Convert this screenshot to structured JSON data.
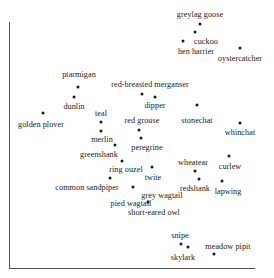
{
  "chart_data": {
    "type": "scatter",
    "title": "",
    "xlabel": "",
    "ylabel": "",
    "grid": false,
    "legend": null,
    "axis_ticks": {
      "x": [],
      "y": []
    },
    "axis_range_px": {
      "x": [
        9,
        255
      ],
      "y": [
        22,
        268
      ]
    },
    "point_color": "#1a1a1a",
    "axis_color": "#555555",
    "background": "#ffffff",
    "points": [
      {
        "label": "greylag goose",
        "x": 200,
        "y": 24,
        "label_x": 200,
        "label_y": 14
      },
      {
        "label": "cuckoo",
        "x": 195,
        "y": 32,
        "label_x": 206,
        "label_y": 41
      },
      {
        "label": "hen harrier",
        "x": 183,
        "y": 41,
        "label_x": 196,
        "label_y": 51
      },
      {
        "label": "oystercatcher",
        "x": 240,
        "y": 48,
        "label_x": 240,
        "label_y": 58
      },
      {
        "label": "ptarmigan",
        "x": 78,
        "y": 87,
        "label_x": 79,
        "label_y": 74
      },
      {
        "label": "dunlin",
        "x": 74,
        "y": 97,
        "label_x": 74,
        "label_y": 106
      },
      {
        "label": "red-breasted merganser",
        "x": 142,
        "y": 94,
        "label_x": 150,
        "label_y": 84
      },
      {
        "label": "dipper",
        "x": 155,
        "y": 97,
        "label_x": 155,
        "label_y": 105
      },
      {
        "label": "golden plover",
        "x": 43,
        "y": 113,
        "label_x": 41,
        "label_y": 124
      },
      {
        "label": "teal",
        "x": 101,
        "y": 122,
        "label_x": 101,
        "label_y": 113
      },
      {
        "label": "merlin",
        "x": 101,
        "y": 131,
        "label_x": 102,
        "label_y": 139
      },
      {
        "label": "red grouse",
        "x": 139,
        "y": 130,
        "label_x": 142,
        "label_y": 120
      },
      {
        "label": "stonechat",
        "x": 197,
        "y": 105,
        "label_x": 197,
        "label_y": 120
      },
      {
        "label": "whinchat",
        "x": 240,
        "y": 123,
        "label_x": 240,
        "label_y": 132
      },
      {
        "label": "peregrine",
        "x": 141,
        "y": 138,
        "label_x": 147,
        "label_y": 147
      },
      {
        "label": "greenshank",
        "x": 115,
        "y": 145,
        "label_x": 99,
        "label_y": 154
      },
      {
        "label": "ring ouzel",
        "x": 122,
        "y": 161,
        "label_x": 126,
        "label_y": 169
      },
      {
        "label": "twite",
        "x": 152,
        "y": 167,
        "label_x": 153,
        "label_y": 177
      },
      {
        "label": "wheatear",
        "x": 195,
        "y": 171,
        "label_x": 193,
        "label_y": 162
      },
      {
        "label": "curlew",
        "x": 229,
        "y": 156,
        "label_x": 230,
        "label_y": 166
      },
      {
        "label": "common sandpiper",
        "x": 110,
        "y": 178,
        "label_x": 87,
        "label_y": 187
      },
      {
        "label": "redshank",
        "x": 199,
        "y": 179,
        "label_x": 195,
        "label_y": 188
      },
      {
        "label": "lapwing",
        "x": 222,
        "y": 181,
        "label_x": 228,
        "label_y": 191
      },
      {
        "label": "grey wagtail",
        "x": 133,
        "y": 187,
        "label_x": 162,
        "label_y": 195
      },
      {
        "label": "pied wagtail",
        "x": 148,
        "y": 202,
        "label_x": 131,
        "label_y": 203
      },
      {
        "label": "short-eared owl",
        "x": 0,
        "y": 0,
        "label_x": 154,
        "label_y": 212,
        "no_point": true
      },
      {
        "label": "snipe",
        "x": 181,
        "y": 244,
        "label_x": 180,
        "label_y": 235
      },
      {
        "label": "skylark",
        "x": 188,
        "y": 247,
        "label_x": 183,
        "label_y": 257
      },
      {
        "label": "meadow pipit",
        "x": 214,
        "y": 254,
        "label_x": 228,
        "label_y": 246
      }
    ]
  }
}
